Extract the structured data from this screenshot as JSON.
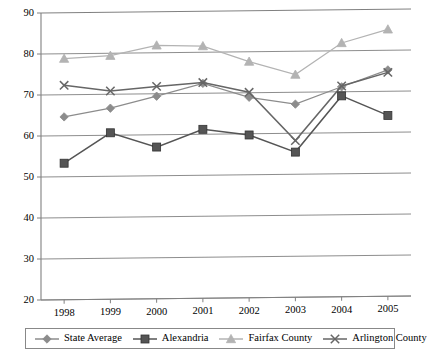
{
  "chart_data": {
    "type": "line",
    "title": "",
    "xlabel": "",
    "ylabel": "",
    "categories": [
      "1998",
      "1999",
      "2000",
      "2001",
      "2002",
      "2003",
      "2004",
      "2005"
    ],
    "ylim": [
      20,
      90
    ],
    "yticks": [
      20,
      30,
      40,
      50,
      60,
      70,
      80,
      90
    ],
    "grid": true,
    "legend_position": "bottom",
    "series": [
      {
        "name": "State Average",
        "marker": "diamond",
        "color": "#8c8c8c",
        "values": [
          64.6,
          66.6,
          69.4,
          72.4,
          68.9,
          67.1,
          71.2,
          75.2
        ]
      },
      {
        "name": "Alexandria",
        "marker": "square",
        "color": "#555555",
        "values": [
          53.3,
          60.6,
          57.0,
          61.2,
          59.7,
          55.4,
          69.0,
          64.1
        ]
      },
      {
        "name": "Fairfax County",
        "marker": "triangle",
        "color": "#b3b3b3",
        "values": [
          78.8,
          79.4,
          81.8,
          81.5,
          77.6,
          74.3,
          81.9,
          85.1
        ]
      },
      {
        "name": "Arlington County",
        "marker": "x",
        "color": "#666666",
        "values": [
          72.3,
          70.8,
          71.8,
          72.6,
          70.1,
          58.2,
          71.4,
          74.6
        ]
      }
    ]
  },
  "axis": {
    "y_tick_labels": [
      "90",
      "80",
      "70",
      "60",
      "50",
      "40",
      "30",
      "20"
    ],
    "x_tick_labels": [
      "1998",
      "1999",
      "2000",
      "2001",
      "2002",
      "2003",
      "2004",
      "2005"
    ]
  },
  "legend": {
    "items": [
      {
        "label": "State Average",
        "marker": "diamond-marker-icon",
        "color": "#8c8c8c"
      },
      {
        "label": "Alexandria",
        "marker": "square-marker-icon",
        "color": "#555555"
      },
      {
        "label": "Fairfax County",
        "marker": "triangle-marker-icon",
        "color": "#b3b3b3"
      },
      {
        "label": "Arlington County",
        "marker": "x-marker-icon",
        "color": "#666666"
      }
    ]
  },
  "colors": {
    "axis": "#808080",
    "grid": "#808080",
    "background": "#ffffff",
    "text": "#000000"
  }
}
